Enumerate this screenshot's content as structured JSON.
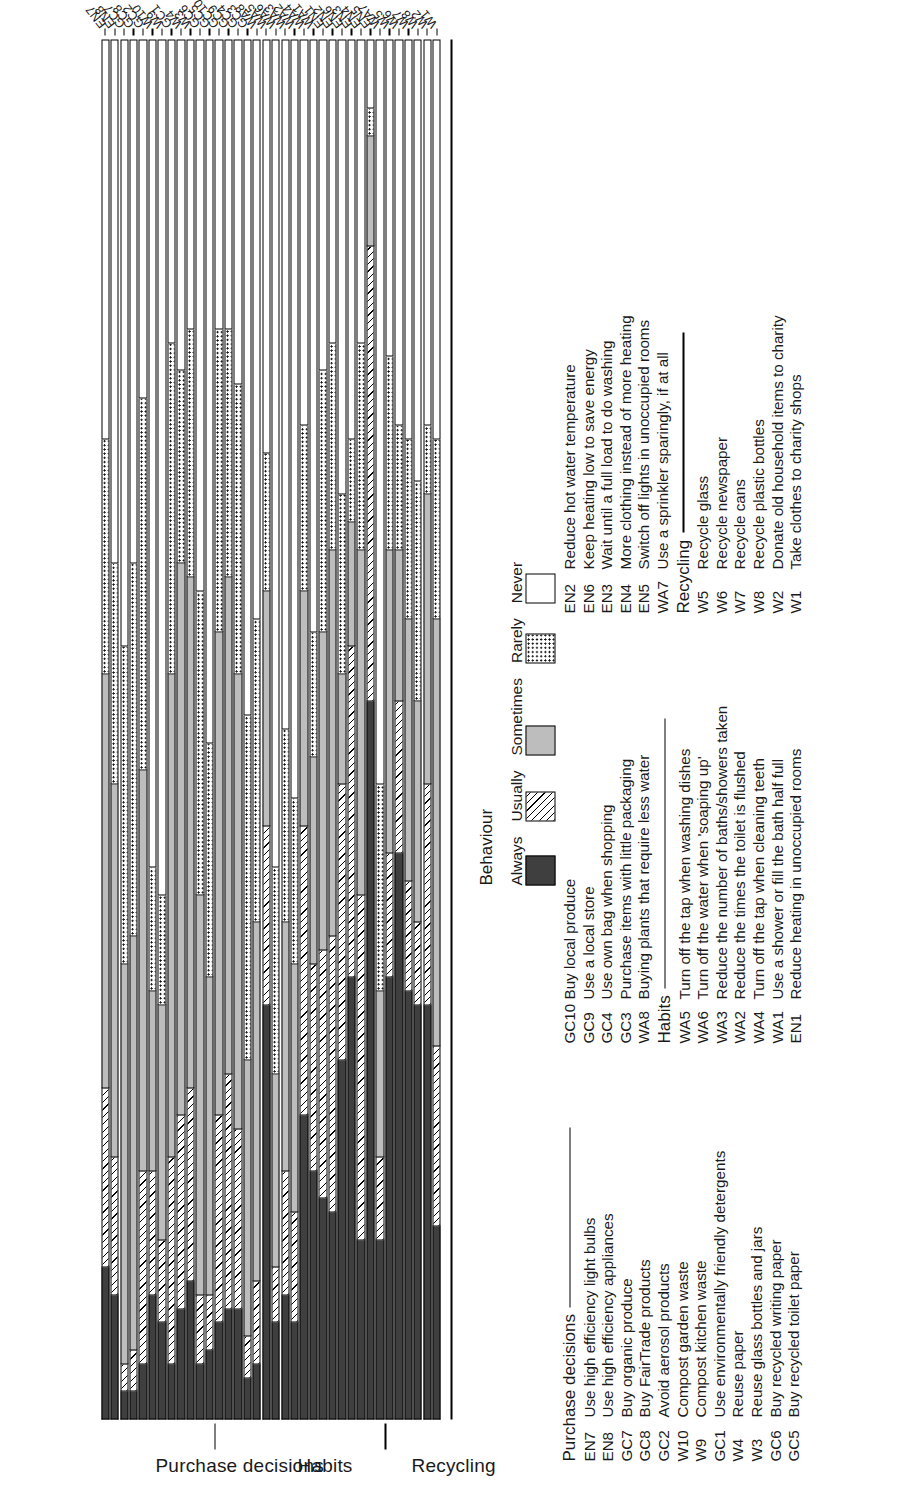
{
  "chart_data": {
    "type": "bar",
    "subtype": "horizontal-stacked-likert-100pct",
    "title": "",
    "xlabel": "",
    "ylabel": "",
    "orientation": "horizontal",
    "stacked": true,
    "grid": false,
    "xlim": [
      0,
      100
    ],
    "legend_position": "right",
    "legend_title": "Behaviour",
    "series": [
      {
        "name": "Always"
      },
      {
        "name": "Usually"
      },
      {
        "name": "Sometimes"
      },
      {
        "name": "Rarely"
      },
      {
        "name": "Never"
      }
    ],
    "group_order": [
      "Purchase decisions",
      "Habits",
      "Recycling"
    ],
    "categories": [
      "EN7",
      "EN8",
      "GC7",
      "GC8",
      "GC2",
      "W10",
      "W9",
      "GC1",
      "W4",
      "W3",
      "GC6",
      "GC5",
      "GC10",
      "GC9",
      "GC4",
      "GC3",
      "WA8",
      "WA5",
      "WA6",
      "WA3",
      "WA2",
      "WA4",
      "WA1",
      "EN1",
      "EN2",
      "EN6",
      "EN3",
      "EN4",
      "EN5",
      "WA7",
      "W5",
      "W6",
      "W7",
      "W8",
      "W2",
      "W1"
    ],
    "values": [
      [
        11,
        13,
        30,
        17,
        29
      ],
      [
        9,
        10,
        27,
        16,
        38
      ],
      [
        2,
        2,
        29,
        23,
        44
      ],
      [
        2,
        3,
        30,
        27,
        38
      ],
      [
        4,
        14,
        29,
        27,
        26
      ],
      [
        9,
        9,
        13,
        9,
        60
      ],
      [
        7,
        6,
        17,
        8,
        62
      ],
      [
        4,
        15,
        35,
        24,
        22
      ],
      [
        8,
        14,
        40,
        14,
        24
      ],
      [
        10,
        14,
        37,
        18,
        21
      ],
      [
        4,
        5,
        29,
        22,
        40
      ],
      [
        5,
        4,
        23,
        17,
        51
      ],
      [
        7,
        15,
        35,
        22,
        21
      ],
      [
        8,
        17,
        36,
        18,
        21
      ],
      [
        8,
        13,
        33,
        21,
        25
      ],
      [
        3,
        3,
        20,
        25,
        49
      ],
      [
        4,
        6,
        26,
        22,
        42
      ],
      [
        30,
        13,
        17,
        10,
        30
      ],
      [
        7,
        4,
        14,
        15,
        60
      ],
      [
        9,
        9,
        18,
        14,
        50
      ],
      [
        7,
        8,
        18,
        12,
        55
      ],
      [
        22,
        21,
        17,
        12,
        28
      ],
      [
        18,
        15,
        15,
        9,
        43
      ],
      [
        16,
        18,
        23,
        19,
        24
      ],
      [
        15,
        20,
        28,
        15,
        22
      ],
      [
        26,
        20,
        8,
        13,
        33
      ],
      [
        32,
        24,
        9,
        6,
        29
      ],
      [
        13,
        25,
        25,
        15,
        22
      ],
      [
        52,
        33,
        8,
        2,
        5
      ],
      [
        13,
        6,
        12,
        15,
        54
      ],
      [
        32,
        9,
        22,
        14,
        23
      ],
      [
        41,
        11,
        11,
        9,
        28
      ],
      [
        31,
        8,
        19,
        13,
        29
      ],
      [
        30,
        6,
        16,
        16,
        32
      ],
      [
        30,
        16,
        21,
        5,
        28
      ],
      [
        14,
        13,
        31,
        13,
        29
      ]
    ],
    "group_separators_after": [
      "GC5",
      "WA7"
    ],
    "section_labels": [
      "Purchase decisions",
      "Habits",
      "Recycling"
    ]
  },
  "legend": {
    "title": "Behaviour",
    "items": [
      {
        "label": "Always",
        "pattern": "solid-dark"
      },
      {
        "label": "Usually",
        "pattern": "diagonal-hatch"
      },
      {
        "label": "Sometimes",
        "pattern": "solid-light-gray"
      },
      {
        "label": "Rarely",
        "pattern": "dotted"
      },
      {
        "label": "Never",
        "pattern": "white"
      }
    ]
  },
  "sections": {
    "purchase": "Purchase decisions",
    "habits": "Habits",
    "recycling": "Recycling"
  },
  "key": {
    "col1": {
      "heading": "Purchase decisions",
      "rows": [
        {
          "code": "EN7",
          "text": "Use high efficiency light bulbs"
        },
        {
          "code": "EN8",
          "text": "Use high efficiency appliances"
        },
        {
          "code": "GC7",
          "text": "Buy organic produce"
        },
        {
          "code": "GC8",
          "text": "Buy FairTrade products"
        },
        {
          "code": "GC2",
          "text": "Avoid aerosol products"
        },
        {
          "code": "W10",
          "text": "Compost garden waste"
        },
        {
          "code": "W9",
          "text": "Compost kitchen waste"
        },
        {
          "code": "GC1",
          "text": "Use environmentally friendly detergents"
        },
        {
          "code": "W4",
          "text": "Reuse paper"
        },
        {
          "code": "W3",
          "text": "Reuse glass bottles and jars"
        },
        {
          "code": "GC6",
          "text": "Buy recycled writing paper"
        },
        {
          "code": "GC5",
          "text": "Buy recycled toilet paper"
        }
      ]
    },
    "col2": {
      "rows_top": [
        {
          "code": "GC10",
          "text": "Buy local produce"
        },
        {
          "code": "GC9",
          "text": "Use a local store"
        },
        {
          "code": "GC4",
          "text": "Use own bag when shopping"
        },
        {
          "code": "GC3",
          "text": "Purchase items with little packaging"
        },
        {
          "code": "WA8",
          "text": "Buying plants that require less water"
        }
      ],
      "heading": "Habits",
      "rows_bottom": [
        {
          "code": "WA5",
          "text": "Turn off the tap when washing dishes"
        },
        {
          "code": "WA6",
          "text": "Turn off the water when 'soaping up'"
        },
        {
          "code": "WA3",
          "text": "Reduce the number of baths/showers taken"
        },
        {
          "code": "WA2",
          "text": "Reduce the times the toilet is flushed"
        },
        {
          "code": "WA4",
          "text": "Turn off the tap when cleaning teeth"
        },
        {
          "code": "WA1",
          "text": "Use a shower or fill the bath half full"
        },
        {
          "code": "EN1",
          "text": "Reduce heating in unoccupied rooms"
        }
      ]
    },
    "col3": {
      "rows_top": [
        {
          "code": "EN2",
          "text": "Reduce hot water temperature"
        },
        {
          "code": "EN6",
          "text": "Keep heating low to save energy"
        },
        {
          "code": "EN3",
          "text": "Wait until a full load to do washing"
        },
        {
          "code": "EN4",
          "text": "More clothing instead of more heating"
        },
        {
          "code": "EN5",
          "text": "Switch off lights in unoccupied rooms"
        },
        {
          "code": "WA7",
          "text": "Use a sprinkler sparingly, if at all"
        }
      ],
      "heading": "Recycling",
      "rows_bottom": [
        {
          "code": "W5",
          "text": "Recycle glass"
        },
        {
          "code": "W6",
          "text": "Recycle newspaper"
        },
        {
          "code": "W7",
          "text": "Recycle cans"
        },
        {
          "code": "W8",
          "text": "Recycle plastic bottles"
        },
        {
          "code": "W2",
          "text": "Donate old household items to charity"
        },
        {
          "code": "W1",
          "text": "Take clothes to charity shops"
        }
      ]
    }
  },
  "colors": {
    "always": "#3f3f3f",
    "sometimes": "#bdbdbd",
    "never": "#ffffff",
    "outline": "#000000"
  }
}
